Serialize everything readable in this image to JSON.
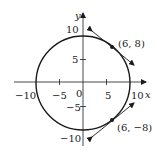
{
  "diagram": {
    "axes": {
      "x_label": "x",
      "y_label": "y",
      "x_ticks": [
        {
          "value": -10,
          "label": "−10"
        },
        {
          "value": -5,
          "label": "−5"
        },
        {
          "value": 0,
          "label": "0"
        },
        {
          "value": 5,
          "label": "5"
        },
        {
          "value": 10,
          "label": "10"
        }
      ],
      "y_ticks": [
        {
          "value": 10,
          "label": "10"
        },
        {
          "value": 5,
          "label": "5"
        },
        {
          "value": -5,
          "label": "−5"
        },
        {
          "value": -10,
          "label": "−10"
        }
      ]
    },
    "circle": {
      "center": [
        0,
        0
      ],
      "radius": 10
    },
    "points": [
      {
        "coords": [
          6,
          8
        ],
        "label": "(6, 8)"
      },
      {
        "coords": [
          6,
          -8
        ],
        "label": "(6, −8)"
      }
    ],
    "colors": {
      "stroke": "#1a1a1a",
      "background": "#ffffff"
    }
  }
}
